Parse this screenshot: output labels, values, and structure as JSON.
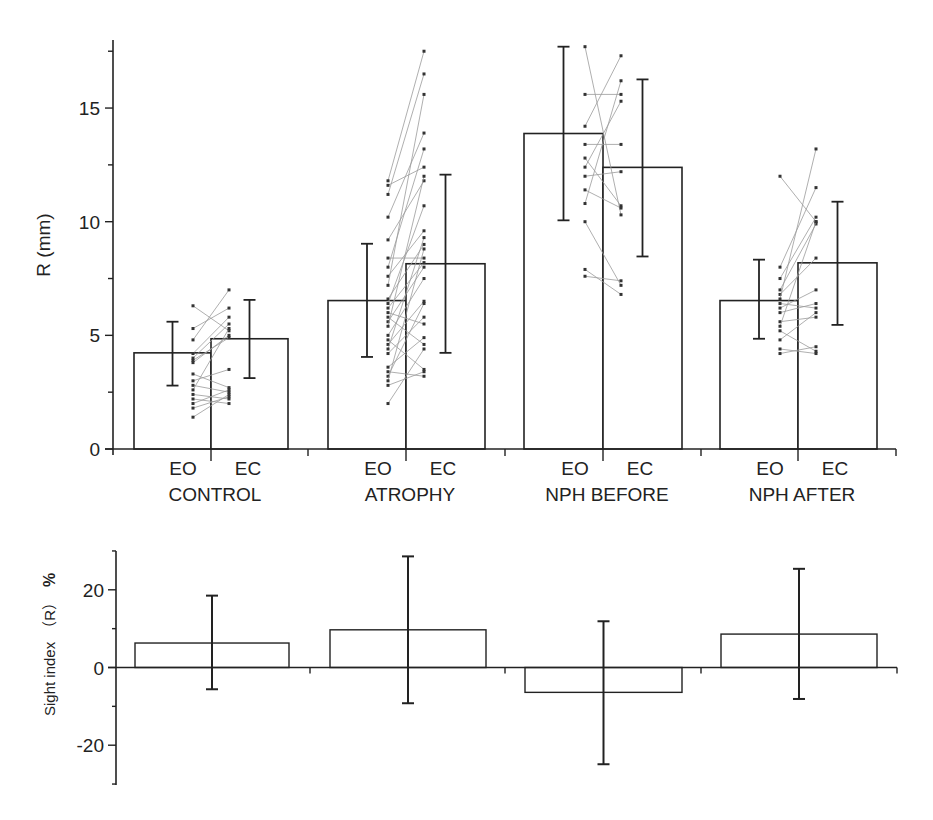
{
  "chart_data": [
    {
      "type": "bar",
      "panel": "top",
      "title": "",
      "xlabel": "",
      "ylabel": "R (mm)",
      "ylim": [
        0,
        18
      ],
      "yticks": [
        0,
        5,
        10,
        15
      ],
      "grid": false,
      "legend": null,
      "groups": [
        "CONTROL",
        "ATROPHY",
        "NPH BEFORE",
        "NPH AFTER"
      ],
      "conditions": [
        "EO",
        "EC"
      ],
      "series": [
        {
          "name": "EO",
          "values": [
            4.23,
            6.53,
            13.88,
            6.53
          ],
          "err_upper": [
            5.6,
            9.03,
            17.7,
            8.33
          ],
          "err_lower": [
            2.79,
            4.05,
            10.06,
            4.85
          ]
        },
        {
          "name": "EC",
          "values": [
            4.85,
            8.15,
            12.39,
            8.19
          ],
          "err_upper": [
            6.56,
            12.07,
            16.26,
            10.88
          ],
          "err_lower": [
            3.12,
            4.23,
            8.47,
            5.46
          ]
        }
      ],
      "paired_points": [
        {
          "group": "CONTROL",
          "pairs": [
            [
              6.3,
              5.2
            ],
            [
              5.3,
              6.2
            ],
            [
              4.8,
              7.0
            ],
            [
              4.2,
              5.8
            ],
            [
              4.0,
              5.5
            ],
            [
              3.8,
              5.0
            ],
            [
              3.9,
              4.9
            ],
            [
              3.3,
              2.7
            ],
            [
              3.0,
              3.5
            ],
            [
              2.8,
              2.5
            ],
            [
              2.6,
              5.3
            ],
            [
              2.4,
              2.2
            ],
            [
              2.2,
              2.0
            ],
            [
              2.0,
              2.6
            ],
            [
              1.8,
              2.3
            ],
            [
              1.4,
              2.4
            ]
          ]
        },
        {
          "group": "ATROPHY",
          "pairs": [
            [
              11.8,
              17.5
            ],
            [
              11.6,
              12.4
            ],
            [
              11.2,
              16.5
            ],
            [
              10.2,
              13.9
            ],
            [
              9.2,
              11.8
            ],
            [
              8.4,
              8.4
            ],
            [
              8.0,
              13.2
            ],
            [
              7.6,
              9.6
            ],
            [
              7.2,
              15.6
            ],
            [
              6.6,
              9.0
            ],
            [
              6.4,
              10.7
            ],
            [
              6.2,
              8.2
            ],
            [
              6.0,
              5.5
            ],
            [
              5.8,
              4.6
            ],
            [
              5.6,
              8.0
            ],
            [
              5.4,
              12.0
            ],
            [
              5.0,
              7.5
            ],
            [
              4.8,
              3.5
            ],
            [
              4.6,
              6.5
            ],
            [
              4.4,
              9.3
            ],
            [
              4.2,
              5.8
            ],
            [
              3.6,
              4.9
            ],
            [
              3.4,
              3.2
            ],
            [
              3.2,
              6.4
            ],
            [
              3.0,
              8.8
            ],
            [
              2.8,
              3.4
            ],
            [
              2.0,
              4.4
            ]
          ]
        },
        {
          "group": "NPH BEFORE",
          "pairs": [
            [
              17.7,
              10.3
            ],
            [
              15.6,
              15.6
            ],
            [
              14.2,
              17.3
            ],
            [
              13.4,
              13.4
            ],
            [
              12.8,
              10.7
            ],
            [
              12.4,
              15.3
            ],
            [
              12.0,
              12.2
            ],
            [
              11.4,
              10.6
            ],
            [
              10.8,
              16.2
            ],
            [
              10.0,
              7.2
            ],
            [
              7.9,
              6.8
            ],
            [
              7.6,
              7.4
            ]
          ]
        },
        {
          "group": "NPH AFTER",
          "pairs": [
            [
              12.0,
              10.0
            ],
            [
              8.0,
              11.5
            ],
            [
              7.5,
              10.2
            ],
            [
              7.0,
              9.9
            ],
            [
              6.8,
              8.4
            ],
            [
              6.6,
              13.2
            ],
            [
              6.4,
              6.2
            ],
            [
              6.2,
              7.0
            ],
            [
              6.0,
              6.4
            ],
            [
              5.6,
              5.8
            ],
            [
              5.4,
              10.0
            ],
            [
              5.2,
              4.3
            ],
            [
              4.8,
              6.0
            ],
            [
              4.4,
              4.2
            ],
            [
              4.2,
              4.5
            ]
          ]
        }
      ]
    },
    {
      "type": "bar",
      "panel": "bottom",
      "title": "",
      "xlabel": "",
      "ylabel": "Sight index（R）%",
      "ylim": [
        -30,
        30
      ],
      "yticks": [
        -20,
        0,
        20
      ],
      "grid": false,
      "legend": null,
      "categories": [
        "CONTROL",
        "ATROPHY",
        "NPH BEFORE",
        "NPH AFTER"
      ],
      "values": [
        6.3,
        9.7,
        -6.4,
        8.6
      ],
      "err_upper": [
        18.5,
        28.6,
        11.9,
        25.4
      ],
      "err_lower": [
        -5.6,
        -9.2,
        -24.9,
        -8.1
      ]
    }
  ],
  "labels": {
    "top_ylabel": "R (mm)",
    "bottom_ylabel_main": "Sight index",
    "bottom_ylabel_paren": "（R）",
    "bottom_ylabel_unit": "%",
    "eo": "EO",
    "ec": "EC",
    "groups": [
      "CONTROL",
      "ATROPHY",
      "NPH BEFORE",
      "NPH AFTER"
    ],
    "top_ytick_labels": [
      "0",
      "5",
      "10",
      "15"
    ],
    "bottom_ytick_labels": [
      "20",
      "0",
      "-20"
    ]
  },
  "colors": {
    "axis": "#222222",
    "bar_stroke": "#222222",
    "bar_fill": "#ffffff",
    "pair_line": "#9a9a9a",
    "pair_point": "#333333"
  }
}
